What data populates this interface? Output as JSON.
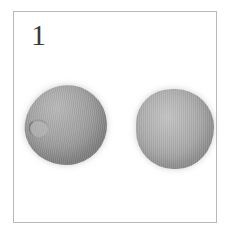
{
  "figure": {
    "panel_label": "1",
    "subjects": [
      {
        "name": "left-seed",
        "description": "grey rounded seed with visible hilum"
      },
      {
        "name": "right-seed",
        "description": "grey rounded seed"
      }
    ],
    "colors": {
      "frame_border": "#b8b8b8",
      "background": "#ffffff",
      "seed_tone": "#a3a3a3",
      "label": "#3a3a3a"
    }
  }
}
